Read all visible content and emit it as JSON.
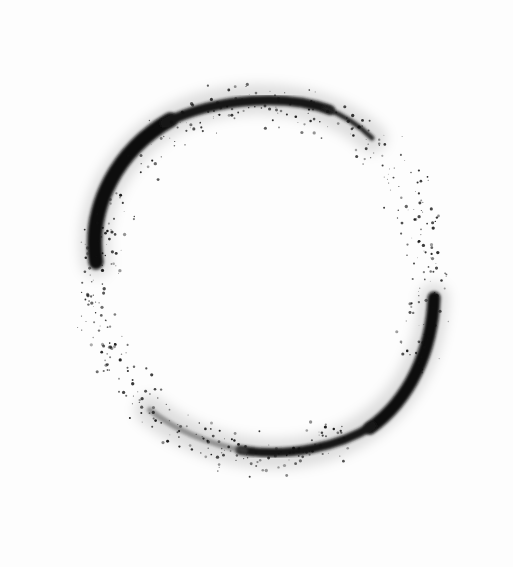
{
  "image": {
    "width": 513,
    "height": 567,
    "background": "#fdfdfd",
    "ink_color": "#111111",
    "subject": "Two spray-painted black arcs forming a broken circle (enso) on white"
  },
  "arcs": [
    {
      "name": "upper-arc",
      "path": "M96 262 C 86 200, 130 130, 200 108 C 260 90, 330 100, 372 138",
      "width_start": 16,
      "width_end": 3
    },
    {
      "name": "lower-arc",
      "path": "M434 298 C 430 360, 400 420, 330 445 C 270 465, 200 450, 150 410",
      "width_start": 14,
      "width_end": 3
    }
  ]
}
